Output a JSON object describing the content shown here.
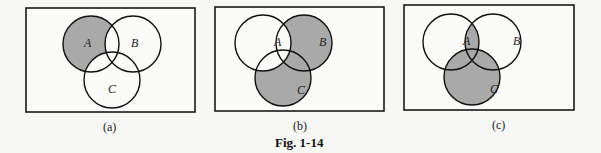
{
  "figure": {
    "caption": "Fig. 1-14",
    "shade_color": "#a9a9a9",
    "panels": [
      {
        "id": "a",
        "caption": "(a)",
        "labels": [
          "A",
          "B",
          "C"
        ],
        "shaded_region": "A - (B ∪ C)"
      },
      {
        "id": "b",
        "caption": "(b)",
        "labels": [
          "A",
          "B",
          "C"
        ],
        "shaded_region": "(B ∪ C) - A"
      },
      {
        "id": "c",
        "caption": "(c)",
        "labels": [
          "A",
          "B",
          "C"
        ],
        "shaded_region": "C ∪ (A ∩ B)"
      }
    ]
  }
}
